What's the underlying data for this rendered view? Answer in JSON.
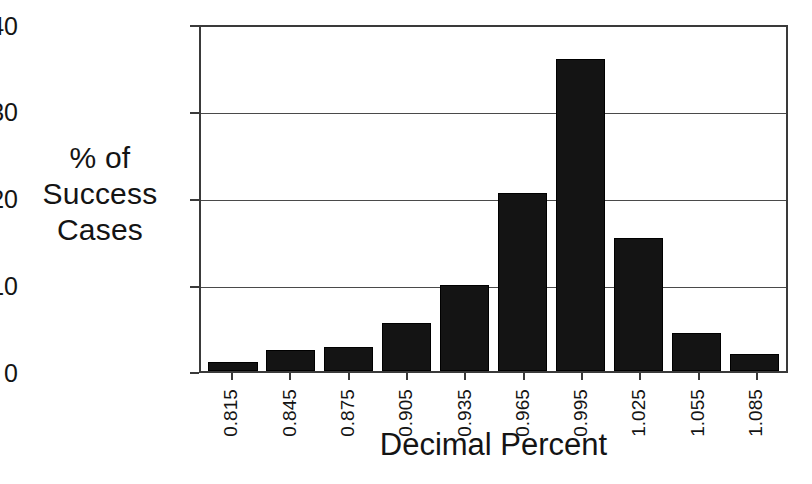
{
  "chart_data": {
    "type": "bar",
    "title": "",
    "subtitle": "",
    "xlabel": "Decimal Percent",
    "ylabel_lines": [
      "% of",
      "Success",
      "Cases"
    ],
    "ylabel": "% of Success Cases",
    "categories": [
      "0.815",
      "0.845",
      "0.875",
      "0.905",
      "0.935",
      "0.965",
      "0.995",
      "1.025",
      "1.055",
      "1.085"
    ],
    "values": [
      1.0,
      2.4,
      2.8,
      5.6,
      10.0,
      20.7,
      36.3,
      15.5,
      4.4,
      2.0
    ],
    "ylim": [
      0,
      40
    ],
    "yticks": [
      0,
      10,
      20,
      30,
      40
    ],
    "ytick_labels": [
      "0",
      "10",
      "20",
      "30",
      "40"
    ],
    "grid": "horizontal",
    "legend": "none",
    "bar_color": "#141414",
    "axis_color": "#3a3a3a",
    "background": "#ffffff"
  }
}
